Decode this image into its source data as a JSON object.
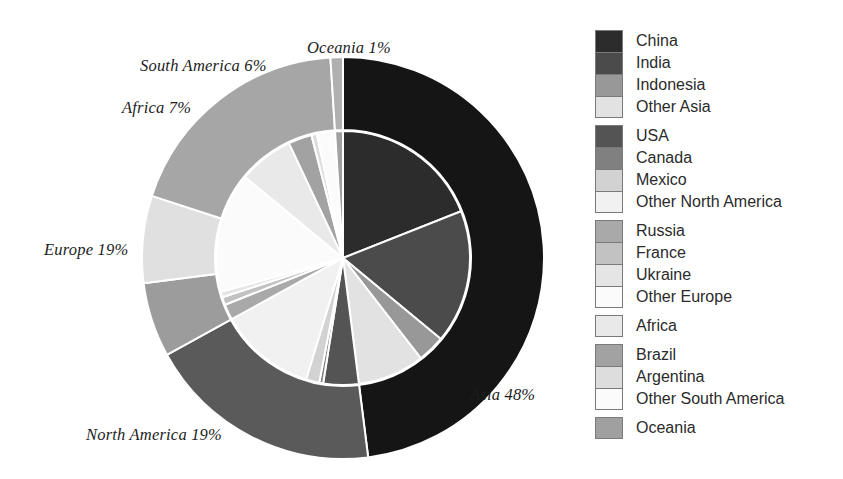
{
  "chart_data": {
    "type": "pie",
    "title": "",
    "subtype": "nested-donut",
    "outer_ring": {
      "name": "Continents",
      "categories": [
        "Asia",
        "North America",
        "South America",
        "Africa",
        "Europe",
        "Oceania"
      ],
      "values": [
        48,
        19,
        6,
        7,
        19,
        1
      ],
      "unit": "%",
      "colors": [
        "#151515",
        "#5a5a5a",
        "#9c9c9c",
        "#e0e0e0",
        "#a6a6a6",
        "#b0b0b0"
      ],
      "start_angle_deg": 0,
      "direction": "clockwise"
    },
    "inner_pie": {
      "name": "Countries",
      "categories": [
        "China",
        "India",
        "Indonesia",
        "Other Asia",
        "USA",
        "Canada",
        "Mexico",
        "Other North America",
        "Russia",
        "France",
        "Ukraine",
        "Other Europe",
        "Africa",
        "Brazil",
        "Argentina",
        "Other South America",
        "Oceania"
      ],
      "values": [
        19,
        17,
        3.5,
        8.5,
        4.5,
        0.5,
        1.7,
        12.3,
        2,
        1,
        0.7,
        15.3,
        7,
        3,
        0.7,
        2.3,
        1
      ],
      "unit": "%",
      "colors": [
        "#2c2c2c",
        "#4b4b4b",
        "#989898",
        "#e2e2e2",
        "#545454",
        "#808080",
        "#d2d2d2",
        "#f1f1f1",
        "#a9a9a9",
        "#c2c2c2",
        "#e5e5e5",
        "#fbfbfb",
        "#e9e9e9",
        "#a2a2a2",
        "#dddddd",
        "#fbfbfb",
        "#a0a0a0"
      ],
      "start_angle_deg": 0,
      "direction": "clockwise"
    },
    "labels": [
      {
        "text": "Oceania 1%",
        "x": 307,
        "y": 38,
        "anchor": "start"
      },
      {
        "text": "South America 6%",
        "x": 140,
        "y": 56,
        "anchor": "start"
      },
      {
        "text": "Africa 7%",
        "x": 122,
        "y": 98,
        "anchor": "start"
      },
      {
        "text": "Europe 19%",
        "x": 44,
        "y": 240,
        "anchor": "start"
      },
      {
        "text": "North America 19%",
        "x": 86,
        "y": 425,
        "anchor": "start"
      },
      {
        "text": "Asia 48%",
        "x": 470,
        "y": 385,
        "anchor": "start"
      }
    ],
    "geometry": {
      "center_x": 343,
      "center_y": 258,
      "outer_radius": 201,
      "ring_inner_radius": 128,
      "inner_pie_radius": 127,
      "separator_color": "#ffffff",
      "separator_width": 2
    },
    "legend_position": "right",
    "grid": false
  },
  "legend": {
    "groups": [
      {
        "name": "asia-group",
        "items": [
          {
            "label": "China",
            "color": "#2c2c2c"
          },
          {
            "label": "India",
            "color": "#4b4b4b"
          },
          {
            "label": "Indonesia",
            "color": "#989898"
          },
          {
            "label": "Other Asia",
            "color": "#e2e2e2"
          }
        ]
      },
      {
        "name": "north-america-group",
        "items": [
          {
            "label": "USA",
            "color": "#545454"
          },
          {
            "label": "Canada",
            "color": "#808080"
          },
          {
            "label": "Mexico",
            "color": "#d2d2d2"
          },
          {
            "label": "Other North America",
            "color": "#f1f1f1"
          }
        ]
      },
      {
        "name": "europe-group",
        "items": [
          {
            "label": "Russia",
            "color": "#a9a9a9"
          },
          {
            "label": "France",
            "color": "#c2c2c2"
          },
          {
            "label": "Ukraine",
            "color": "#e5e5e5"
          },
          {
            "label": "Other Europe",
            "color": "#fbfbfb"
          }
        ]
      },
      {
        "name": "africa-group",
        "items": [
          {
            "label": "Africa",
            "color": "#e9e9e9"
          }
        ]
      },
      {
        "name": "south-america-group",
        "items": [
          {
            "label": "Brazil",
            "color": "#a2a2a2"
          },
          {
            "label": "Argentina",
            "color": "#dddddd"
          },
          {
            "label": "Other South America",
            "color": "#fbfbfb"
          }
        ]
      },
      {
        "name": "oceania-group",
        "items": [
          {
            "label": "Oceania",
            "color": "#a0a0a0"
          }
        ]
      }
    ]
  }
}
